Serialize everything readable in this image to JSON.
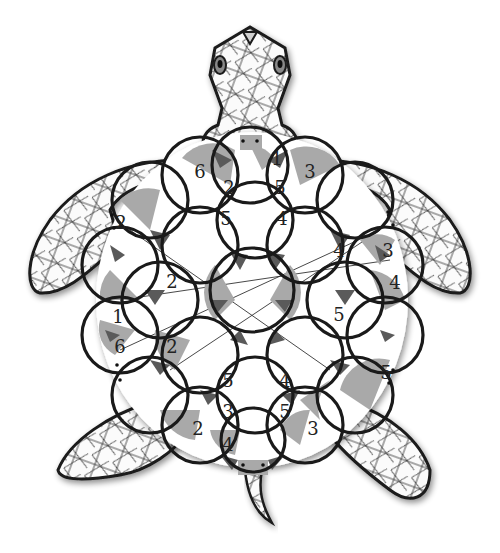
{
  "puzzle": {
    "title": "Turtle circle puzzle",
    "colors": {
      "light_gray": "#a9a9a9",
      "dark_gray": "#5a5a5a",
      "outline": "#1a1a1a",
      "background": "#ffffff"
    },
    "clues": [
      {
        "id": "c1",
        "value": "6",
        "x": 200,
        "y": 171
      },
      {
        "id": "c2",
        "value": "1",
        "x": 277,
        "y": 158
      },
      {
        "id": "c3",
        "value": "3",
        "x": 310,
        "y": 171
      },
      {
        "id": "c4",
        "value": "2",
        "x": 229,
        "y": 187
      },
      {
        "id": "c5",
        "value": "5",
        "x": 280,
        "y": 187
      },
      {
        "id": "c6",
        "value": "5",
        "x": 226,
        "y": 218
      },
      {
        "id": "c7",
        "value": "4",
        "x": 282,
        "y": 218
      },
      {
        "id": "c8",
        "value": "2",
        "x": 121,
        "y": 222
      },
      {
        "id": "c9",
        "value": "4",
        "x": 339,
        "y": 250
      },
      {
        "id": "c10",
        "value": "3",
        "x": 388,
        "y": 250
      },
      {
        "id": "c11",
        "value": "2",
        "x": 172,
        "y": 281
      },
      {
        "id": "c12",
        "value": "4",
        "x": 395,
        "y": 282
      },
      {
        "id": "c13",
        "value": "1",
        "x": 118,
        "y": 316
      },
      {
        "id": "c14",
        "value": "5",
        "x": 339,
        "y": 314
      },
      {
        "id": "c15",
        "value": "6",
        "x": 120,
        "y": 346
      },
      {
        "id": "c16",
        "value": "2",
        "x": 172,
        "y": 346
      },
      {
        "id": "c17",
        "value": "5",
        "x": 386,
        "y": 372
      },
      {
        "id": "c18",
        "value": "5",
        "x": 228,
        "y": 380
      },
      {
        "id": "c19",
        "value": "4",
        "x": 285,
        "y": 380
      },
      {
        "id": "c20",
        "value": "3",
        "x": 228,
        "y": 411
      },
      {
        "id": "c21",
        "value": "5",
        "x": 285,
        "y": 411
      },
      {
        "id": "c22",
        "value": "2",
        "x": 198,
        "y": 428
      },
      {
        "id": "c23",
        "value": "3",
        "x": 313,
        "y": 428
      },
      {
        "id": "c24",
        "value": "4",
        "x": 228,
        "y": 444
      }
    ]
  }
}
